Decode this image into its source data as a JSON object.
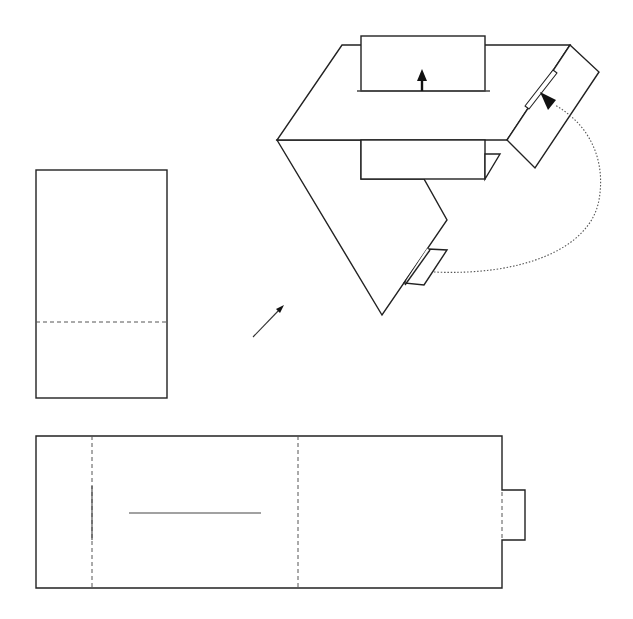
{
  "diagram": {
    "type": "folding-instructions",
    "colors": {
      "stroke": "#222222",
      "fold_line": "#555555",
      "background": "#ffffff",
      "arrow": "#111111"
    },
    "legend": {
      "solid_line": "cut / edge",
      "dashed_line": "fold line",
      "dotted_curve": "insertion path"
    },
    "panels": [
      {
        "id": "small-sheet",
        "description": "Tall rectangle with a horizontal dashed fold line near the bottom",
        "rect": [
          36,
          170,
          131,
          228
        ],
        "fold_lines": [
          {
            "orientation": "horizontal",
            "y": 322
          }
        ]
      },
      {
        "id": "long-sheet",
        "description": "Long horizontal strip with two vertical dashed fold lines, a horizontal slot, a short vertical cut, and a tab on the right",
        "rect": [
          36,
          436,
          466,
          152
        ],
        "fold_lines": [
          {
            "orientation": "vertical",
            "x": 92
          },
          {
            "orientation": "vertical",
            "x": 298
          }
        ],
        "slot": {
          "x1": 129,
          "x2": 261,
          "y": 513
        },
        "vertical_cut": {
          "x": 92,
          "y1": 486,
          "y2": 540
        },
        "tab": {
          "x": 502,
          "y": 490,
          "width": 23,
          "height": 50
        }
      },
      {
        "id": "assembled-view",
        "description": "Folded assembly in 3D, a tab is inserted into a slot following a dotted curved path",
        "arrows": [
          "up-arrow at slot",
          "insertion arrow into angled slot"
        ]
      }
    ],
    "step_arrow": {
      "from": [
        253,
        337
      ],
      "to": [
        283,
        306
      ],
      "meaning": "proceed to assembled view"
    }
  }
}
